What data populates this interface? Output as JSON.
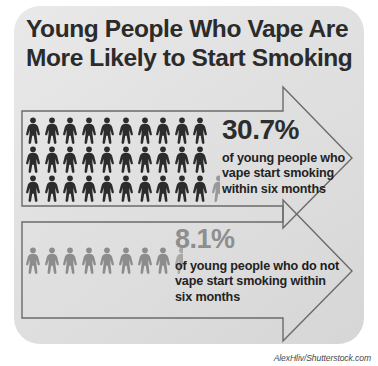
{
  "title": {
    "line1": "Young People Who Vape Are",
    "line2": "More Likely to Start Smoking"
  },
  "stats": [
    {
      "id": "vape",
      "percent": "30.7%",
      "description_prefix": "of young people who vape start smoking within six months",
      "desc_line1": "of young people who",
      "desc_line2": "vape start smoking",
      "desc_line3": "within six months",
      "figures_full": 30,
      "figures_partial": 1,
      "rows": 3,
      "per_row": 10,
      "figure_color": "#2c2c2c",
      "partial_color": "#999999",
      "percent_color": "#2d2d2d"
    },
    {
      "id": "non-vape",
      "percent": "8.1%",
      "description_prefix": "of young people who do not vape start smoking within six months",
      "desc_line1_a": "of young people who ",
      "desc_line1_bold": "do not",
      "desc_line2": "vape start smoking within",
      "desc_line3": "six months",
      "figures_full": 8,
      "figures_partial": 1,
      "rows": 1,
      "per_row": 9,
      "figure_color": "#8c8c8c",
      "partial_color": "#a8a8a8",
      "percent_color": "#8e8e8e"
    }
  ],
  "chart_data": {
    "type": "bar",
    "title": "Young People Who Vape Are More Likely to Start Smoking",
    "categories": [
      "Young people who vape",
      "Young people who do not vape"
    ],
    "values": [
      30.7,
      8.1
    ],
    "unit": "percent",
    "xlabel": "",
    "ylabel": "Percent who start smoking within six months",
    "ylim": [
      0,
      100
    ],
    "pictogram_unit": "1 figure = 1 percent",
    "grid": false,
    "legend": "none",
    "annotations": [
      "30.7% of young people who vape start smoking within six months",
      "8.1% of young people who do not vape start smoking within six months"
    ]
  },
  "credit": "AlexHliv/Shutterstock.com",
  "colors": {
    "card_background": "#e2e2e2",
    "title_text": "#2b2b2b",
    "dark_figure": "#2c2c2c",
    "gray_figure": "#8c8c8c",
    "arrow_outline": "#6b6b6b"
  }
}
